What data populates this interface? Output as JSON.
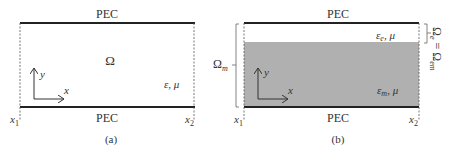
{
  "panel_a": {
    "caption": "(a)",
    "top_boundary": "PEC",
    "bottom_boundary": "PEC",
    "domain_label": "Ω",
    "material": {
      "eps": "ε",
      "sep": ", ",
      "mu": "μ"
    },
    "axes": {
      "x": "x",
      "y": "y"
    },
    "x_left": {
      "base": "x",
      "sub": "1"
    },
    "x_right": {
      "base": "x",
      "sub": "2"
    }
  },
  "panel_b": {
    "caption": "(b)",
    "top_boundary": "PEC",
    "bottom_boundary": "PEC",
    "upper_material": {
      "eps": "ε",
      "eps_sub": "e",
      "sep": ", ",
      "mu": "μ"
    },
    "lower_material": {
      "eps": "ε",
      "eps_sub": "m",
      "sep": ", ",
      "mu": "μ"
    },
    "axes": {
      "x": "x",
      "y": "y"
    },
    "x_left": {
      "base": "x",
      "sub": "1"
    },
    "x_right": {
      "base": "x",
      "sub": "2"
    },
    "left_bracket": {
      "base": "Ω",
      "sub": "m"
    },
    "right_bracket": {
      "base1": "Ω",
      "sub1": "e",
      "eq": " = ",
      "base2": "Ω",
      "sub2": "em"
    },
    "fill_color": "#b0b0b0"
  },
  "colors": {
    "line": "#222222",
    "text": "#333333",
    "fill": "#b0b0b0"
  }
}
